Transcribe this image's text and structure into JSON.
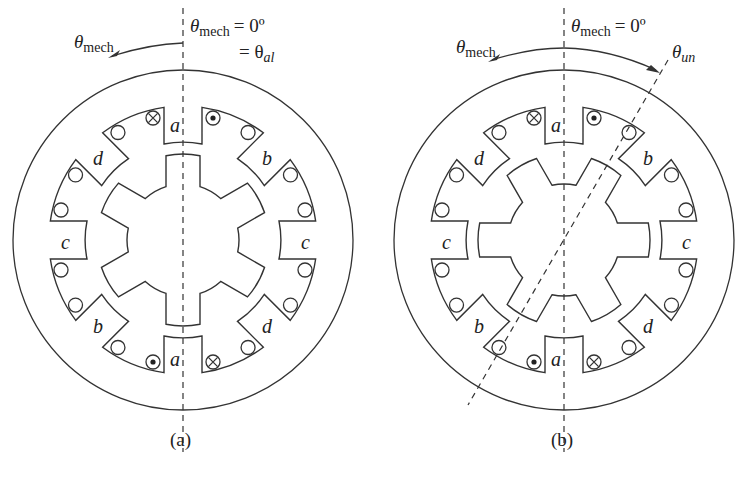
{
  "figure": {
    "panels": [
      {
        "id": "a",
        "caption": "(a)",
        "center": [
          183,
          240
        ],
        "rotor_offset_deg": 0,
        "annotations": {
          "arrow_label": "θ",
          "arrow_label_sub": "mech",
          "ref_line_label": "θ",
          "ref_line_label_sub": "mech",
          "ref_line_eq": "= 0º",
          "second_line_eq": "= θ",
          "second_line_sub": "al"
        },
        "stator_pole_labels": [
          {
            "name": "a",
            "pos": [
              170,
              132
            ]
          },
          {
            "name": "b",
            "pos": [
              262,
              165
            ]
          },
          {
            "name": "c",
            "pos": [
              301,
              249
            ]
          },
          {
            "name": "d",
            "pos": [
              262,
              333
            ]
          },
          {
            "name": "a",
            "pos": [
              170,
              366
            ]
          },
          {
            "name": "b",
            "pos": [
              93,
              333
            ]
          },
          {
            "name": "c",
            "pos": [
              61,
              249
            ]
          },
          {
            "name": "d",
            "pos": [
              93,
              165
            ]
          }
        ]
      },
      {
        "id": "b",
        "caption": "(b)",
        "center": [
          564,
          240
        ],
        "rotor_offset_deg": 30,
        "annotations": {
          "arrow_label": "θ",
          "arrow_label_sub": "mech",
          "ref_line_label": "θ",
          "ref_line_label_sub": "mech",
          "ref_line_eq": "= 0º",
          "unaligned_label": "θ",
          "unaligned_sub": "un"
        },
        "stator_pole_labels": [
          {
            "name": "a",
            "pos": [
              551,
              132
            ]
          },
          {
            "name": "b",
            "pos": [
              643,
              165
            ]
          },
          {
            "name": "c",
            "pos": [
              682,
              249
            ]
          },
          {
            "name": "d",
            "pos": [
              643,
              333
            ]
          },
          {
            "name": "a",
            "pos": [
              551,
              366
            ]
          },
          {
            "name": "b",
            "pos": [
              474,
              333
            ]
          },
          {
            "name": "c",
            "pos": [
              442,
              249
            ]
          },
          {
            "name": "d",
            "pos": [
              474,
              165
            ]
          }
        ]
      }
    ],
    "stator_poles": 8,
    "rotor_poles": 6,
    "coil_symbols": {
      "into_page": "⊗",
      "out_of_page": "⊙"
    },
    "colors": {
      "stroke": "#333333",
      "background": "#ffffff"
    }
  }
}
